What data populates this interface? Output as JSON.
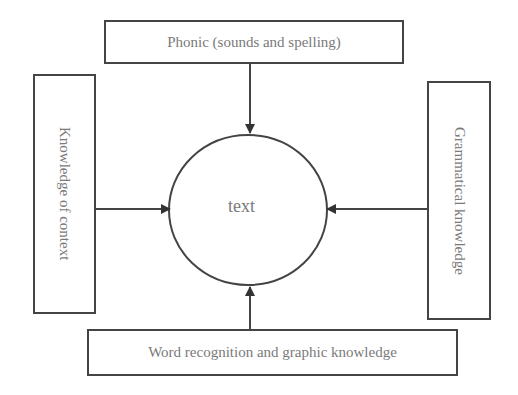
{
  "diagram": {
    "center": {
      "label": "text"
    },
    "nodes": [
      {
        "id": "top",
        "label": "Phonic (sounds and spelling)",
        "position": "top"
      },
      {
        "id": "left",
        "label": "Knowledge of context",
        "position": "left"
      },
      {
        "id": "right",
        "label": "Grammatical knowledge",
        "position": "right"
      },
      {
        "id": "bottom",
        "label": "Word recognition and graphic knowledge",
        "position": "bottom"
      }
    ],
    "edges": [
      {
        "from": "top",
        "to": "center"
      },
      {
        "from": "left",
        "to": "center"
      },
      {
        "from": "right",
        "to": "center"
      },
      {
        "from": "bottom",
        "to": "center"
      }
    ],
    "colors": {
      "stroke": "#444444",
      "text": "#7a7a7a",
      "background": "#ffffff"
    }
  }
}
